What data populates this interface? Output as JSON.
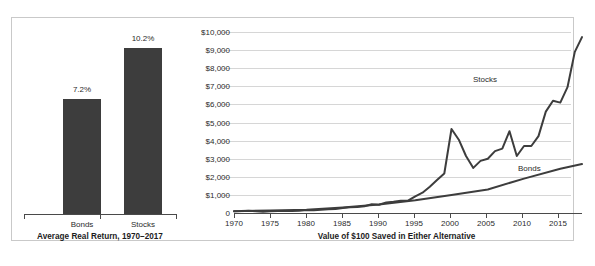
{
  "figure": {
    "background": "#ffffff",
    "frame_color": "#c9c9c9",
    "bar_color": "#3d3d3d",
    "line_color": "#3d3d3d",
    "grid_color": "#d6d6d6",
    "axis_color": "#4a4a4a"
  },
  "chart_data": [
    {
      "type": "bar",
      "title": "Average Real Return, 1970–2017",
      "categories": [
        "Bonds",
        "Stocks"
      ],
      "values": [
        7.2,
        10.2
      ],
      "value_labels": [
        "7.2%",
        "10.2%"
      ],
      "xlabel": "",
      "ylabel": "",
      "ylim": [
        0,
        12
      ],
      "grid": false,
      "legend": "none"
    },
    {
      "type": "line",
      "title": "Value of $100 Saved in Either Alternative",
      "xlabel": "",
      "ylabel": "",
      "xlim": [
        1970,
        2018
      ],
      "ylim": [
        0,
        10000
      ],
      "grid": true,
      "gridlines_y": [
        1000,
        2000,
        3000,
        4000,
        5000,
        6000,
        7000,
        8000,
        9000,
        10000
      ],
      "ytick_labels": [
        "$10,000",
        "$9,000",
        "$8,000",
        "$7,000",
        "$6,000",
        "$5,000",
        "$4,000",
        "$3,000",
        "$2,000",
        "$1,000",
        "0"
      ],
      "ytick_values": [
        10000,
        9000,
        8000,
        7000,
        6000,
        5000,
        4000,
        3000,
        2000,
        1000,
        0
      ],
      "xtick_labels": [
        "1970",
        "1975",
        "1980",
        "1985",
        "1990",
        "1995",
        "2000",
        "2005",
        "2010",
        "2015"
      ],
      "xtick_values": [
        1970,
        1975,
        1980,
        1985,
        1990,
        1995,
        2000,
        2005,
        2010,
        2015
      ],
      "legend": "inline-annotations",
      "annotations": [
        {
          "text": "Stocks",
          "x": 2006,
          "y": 6300
        },
        {
          "text": "Bonds",
          "x": 2012,
          "y": 3200
        }
      ],
      "series": [
        {
          "name": "Stocks",
          "x": [
            1970,
            1971,
            1972,
            1973,
            1974,
            1975,
            1976,
            1977,
            1978,
            1979,
            1980,
            1981,
            1982,
            1983,
            1984,
            1985,
            1986,
            1987,
            1988,
            1989,
            1990,
            1991,
            1992,
            1993,
            1994,
            1995,
            1996,
            1997,
            1998,
            1999,
            2000,
            2001,
            2002,
            2003,
            2004,
            2005,
            2006,
            2007,
            2008,
            2009,
            2010,
            2011,
            2012,
            2013,
            2014,
            2015,
            2016,
            2017,
            2018
          ],
          "values": [
            100,
            104,
            120,
            100,
            72,
            95,
            115,
            105,
            108,
            125,
            160,
            148,
            175,
            208,
            215,
            275,
            320,
            330,
            375,
            480,
            455,
            585,
            625,
            680,
            680,
            920,
            1120,
            1450,
            1820,
            2180,
            1990,
            1750,
            1380,
            1750,
            1930,
            2020,
            2320,
            2430,
            1520,
            1900,
            2180,
            2210,
            2540,
            3330,
            3770,
            3750,
            4150,
            5000,
            5300
          ],
          "y_rendered": [
            100,
            104,
            120,
            100,
            72,
            95,
            115,
            105,
            108,
            125,
            160,
            148,
            175,
            208,
            215,
            275,
            320,
            330,
            375,
            480,
            455,
            585,
            625,
            680,
            680,
            920,
            1120,
            1450,
            1820,
            2180,
            4640,
            4050,
            3150,
            2490,
            2880,
            3000,
            3420,
            3560,
            4520,
            3150,
            3700,
            3700,
            4250,
            5600,
            6200,
            6100,
            6950,
            8900,
            9720
          ]
        },
        {
          "name": "Bonds",
          "x": [
            1970,
            1975,
            1980,
            1985,
            1990,
            1995,
            2000,
            2005,
            2010,
            2015,
            2018
          ],
          "values": [
            100,
            130,
            175,
            310,
            470,
            700,
            1000,
            1300,
            1900,
            2450,
            2700
          ],
          "y_rendered": [
            100,
            130,
            175,
            310,
            470,
            700,
            1000,
            1300,
            1900,
            2450,
            2700
          ]
        }
      ]
    }
  ],
  "bar_chart": {
    "caption": "Average Real Return, 1970–2017",
    "bars": [
      {
        "label": "Bonds",
        "value_label": "7.2%",
        "value": 7.2
      },
      {
        "label": "Stocks",
        "value_label": "10.2%",
        "value": 10.2
      }
    ]
  },
  "line_chart": {
    "caption": "Value of $100 Saved in Either Alternative",
    "series_labels": {
      "stocks": "Stocks",
      "bonds": "Bonds"
    },
    "y_labels": [
      "$10,000",
      "$9,000",
      "$8,000",
      "$7,000",
      "$6,000",
      "$5,000",
      "$4,000",
      "$3,000",
      "$2,000",
      "$1,000",
      "0"
    ],
    "x_labels": [
      "1970",
      "1975",
      "1980",
      "1985",
      "1990",
      "1995",
      "2000",
      "2005",
      "2010",
      "2015"
    ]
  }
}
